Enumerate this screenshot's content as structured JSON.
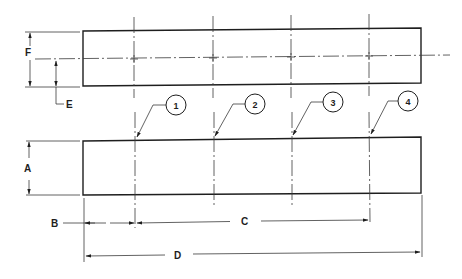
{
  "drawing": {
    "title": "Two-view part drawing with dimensions and item balloons",
    "colors": {
      "line": "#1e1e1e",
      "background": "#ffffff"
    },
    "views": [
      {
        "name": "top-view",
        "shape": "rectangle",
        "x": 83,
        "y": 29,
        "width": 338,
        "height": 55
      },
      {
        "name": "front-view",
        "shape": "rectangle",
        "x": 83,
        "y": 139,
        "width": 338,
        "height": 56
      }
    ],
    "dimensions": {
      "A": "A",
      "B": "B",
      "C": "C",
      "D": "D",
      "E": "E",
      "F": "F"
    },
    "balloons": [
      {
        "label": "1",
        "cx": 176,
        "cy": 105
      },
      {
        "label": "2",
        "cx": 255,
        "cy": 104
      },
      {
        "label": "3",
        "cx": 333,
        "cy": 102
      },
      {
        "label": "4",
        "cx": 408,
        "cy": 101
      }
    ],
    "hole_center_x": [
      135,
      214,
      292,
      369
    ]
  }
}
